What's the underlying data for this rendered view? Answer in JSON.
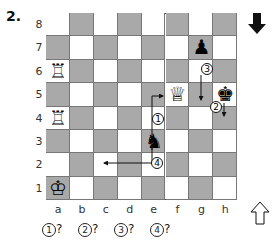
{
  "diagram": {
    "number": "2.",
    "ranks": [
      "8",
      "7",
      "6",
      "5",
      "4",
      "3",
      "2",
      "1"
    ],
    "files": [
      "a",
      "b",
      "c",
      "d",
      "e",
      "f",
      "g",
      "h"
    ],
    "to_move_indicator": "black-to-move (down arrow)",
    "orientation_indicator": "white (up arrow)",
    "pieces": [
      {
        "square": "a6",
        "piece": "white-rook",
        "glyph": "♖"
      },
      {
        "square": "a4",
        "piece": "white-rook",
        "glyph": "♖"
      },
      {
        "square": "a1",
        "piece": "white-king",
        "glyph": "♔"
      },
      {
        "square": "f5",
        "piece": "white-queen",
        "glyph": "♕"
      },
      {
        "square": "g7",
        "piece": "black-pawn",
        "glyph": "♟"
      },
      {
        "square": "h5",
        "piece": "black-king",
        "glyph": "♚"
      },
      {
        "square": "e3",
        "piece": "black-knight",
        "glyph": "♞"
      }
    ],
    "moves": [
      {
        "label": "1",
        "from": "e4",
        "to": "f5"
      },
      {
        "label": "2",
        "from": "h5",
        "to": "h4"
      },
      {
        "label": "3",
        "from": "g7",
        "to": "g5"
      },
      {
        "label": "4",
        "from": "e3",
        "to": "c2"
      }
    ],
    "questions": [
      "1",
      "2",
      "3",
      "4"
    ],
    "question_suffix": "?"
  }
}
